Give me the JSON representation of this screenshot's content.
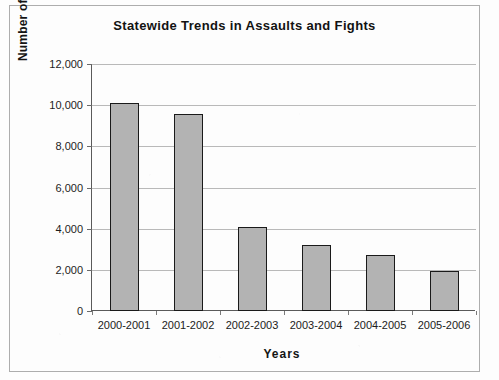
{
  "chart_data": {
    "type": "bar",
    "title": "Statewide Trends in Assaults and Fights",
    "xlabel": "Years",
    "ylabel": "Number of Assaults an Fights",
    "categories": [
      "2000-2001",
      "2001-2002",
      "2002-2003",
      "2003-2004",
      "2004-2005",
      "2005-2006"
    ],
    "values": [
      10100,
      9550,
      4100,
      3200,
      2700,
      1950
    ],
    "series": [
      {
        "name": "Assaults and Fights",
        "values": [
          10100,
          9550,
          4100,
          3200,
          2700,
          1950
        ]
      }
    ],
    "ylim": [
      0,
      12000
    ],
    "ytick_values": [
      0,
      2000,
      4000,
      6000,
      8000,
      10000,
      12000
    ],
    "ytick_labels": [
      "0",
      "2,000",
      "4,000",
      "6,000",
      "8,000",
      "10,000",
      "12,000"
    ],
    "grid": true,
    "grid_axis": "y",
    "legend": false,
    "legend_position": "none",
    "bar_fill_color": "#b3b3b3",
    "bar_border_color": "#1a1a1a",
    "gridline_color": "#b9b9b9",
    "axis_color": "#5a5a5a",
    "background_color": "#ffffff",
    "frame_border_color": "#adadad"
  }
}
